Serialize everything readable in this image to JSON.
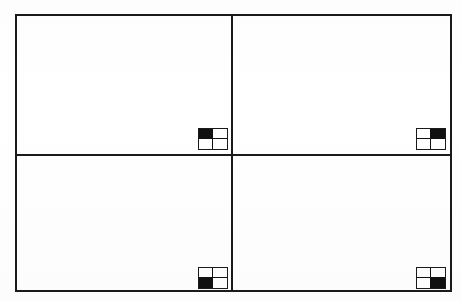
{
  "diagram": {
    "background_color": "#ffffff",
    "line_color": "#1a1a1a",
    "fill_color": "#111111",
    "frame": {
      "name": "outer-rectangle",
      "x": 15,
      "y": 14,
      "width": 437,
      "height": 278,
      "border_width": 2
    },
    "dividers": [
      {
        "name": "vertical-divider",
        "orientation": "vertical",
        "position": 231,
        "thickness": 2
      },
      {
        "name": "horizontal-divider",
        "orientation": "horizontal",
        "position": 154,
        "thickness": 2
      }
    ],
    "quadrants": [
      {
        "id": "top-left",
        "label": "",
        "row": 0,
        "col": 0,
        "content": ""
      },
      {
        "id": "top-right",
        "label": "",
        "row": 0,
        "col": 1,
        "content": ""
      },
      {
        "id": "bottom-left",
        "label": "",
        "row": 1,
        "col": 0,
        "content": ""
      },
      {
        "id": "bottom-right",
        "label": "",
        "row": 1,
        "col": 1,
        "content": ""
      }
    ],
    "indicators": [
      {
        "id": "indicator-top-left",
        "icon": "quadrant-map-icon",
        "for_quadrant": "top-left",
        "grid_rows": 2,
        "grid_cols": 2,
        "filled_cell": "top-left",
        "cells": [
          "filled",
          "empty",
          "empty",
          "empty"
        ],
        "width": 30,
        "height": 22
      },
      {
        "id": "indicator-top-right",
        "icon": "quadrant-map-icon",
        "for_quadrant": "top-right",
        "grid_rows": 2,
        "grid_cols": 2,
        "filled_cell": "top-right",
        "cells": [
          "empty",
          "filled",
          "empty",
          "empty"
        ],
        "width": 30,
        "height": 22
      },
      {
        "id": "indicator-bottom-left",
        "icon": "quadrant-map-icon",
        "for_quadrant": "bottom-left",
        "grid_rows": 2,
        "grid_cols": 2,
        "filled_cell": "bottom-left",
        "cells": [
          "empty",
          "empty",
          "filled",
          "empty"
        ],
        "width": 30,
        "height": 22
      },
      {
        "id": "indicator-bottom-right",
        "icon": "quadrant-map-icon",
        "for_quadrant": "bottom-right",
        "grid_rows": 2,
        "grid_cols": 2,
        "filled_cell": "bottom-right",
        "cells": [
          "empty",
          "empty",
          "empty",
          "filled"
        ],
        "width": 30,
        "height": 22
      }
    ]
  }
}
